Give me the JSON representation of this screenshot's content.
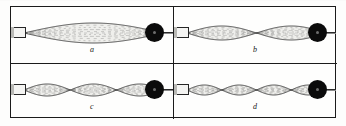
{
  "figure": {
    "panel_count": 4,
    "frame_color": "#1b1b1b",
    "background_color": "#fdfdfc",
    "string_color": "#3a3a3a",
    "pulley_color": "#0b0b0b",
    "anchor_color": "#f4f4f2"
  },
  "panels": [
    {
      "id": "a",
      "caption": "a",
      "loops": 1,
      "harmonic": "1",
      "anchor_name": "vibrator-clamp",
      "pulley_name": "pulley",
      "envelope_amplitude": 10
    },
    {
      "id": "b",
      "caption": "b",
      "loops": 2,
      "harmonic": "2",
      "anchor_name": "vibrator-clamp",
      "pulley_name": "pulley",
      "envelope_amplitude": 7
    },
    {
      "id": "c",
      "caption": "c",
      "loops": 3,
      "harmonic": "3",
      "anchor_name": "vibrator-clamp",
      "pulley_name": "pulley",
      "envelope_amplitude": 6
    },
    {
      "id": "d",
      "caption": "d",
      "loops": 4,
      "harmonic": "4",
      "anchor_name": "vibrator-clamp",
      "pulley_name": "pulley",
      "envelope_amplitude": 5
    }
  ],
  "chart_data": {
    "type": "line",
    "xlabel": "",
    "ylabel": "",
    "x": [
      0,
      1
    ],
    "series": [
      {
        "name": "a",
        "loops": 1,
        "amplitude": 10,
        "values": [
          0,
          0
        ]
      },
      {
        "name": "b",
        "loops": 2,
        "amplitude": 7,
        "values": [
          0,
          0
        ]
      },
      {
        "name": "c",
        "loops": 3,
        "amplitude": 6,
        "values": [
          0,
          0
        ]
      },
      {
        "name": "d",
        "loops": 4,
        "amplitude": 5,
        "values": [
          0,
          0
        ]
      }
    ],
    "legend": [
      "a",
      "b",
      "c",
      "d"
    ],
    "grid": false
  }
}
